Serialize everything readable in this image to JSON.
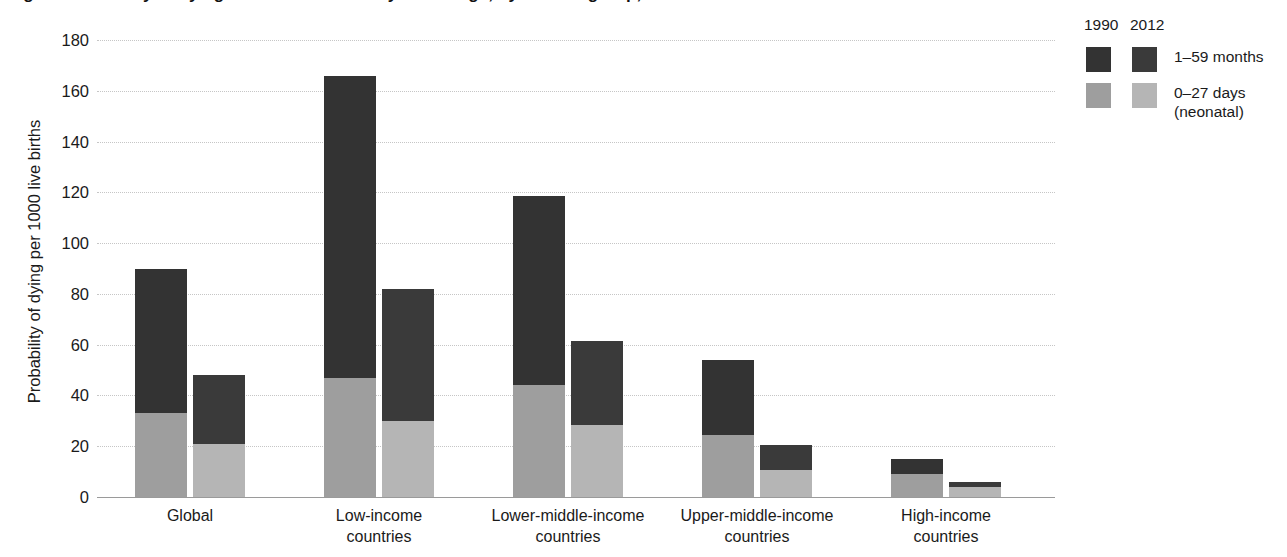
{
  "chart_data": {
    "type": "bar",
    "subtype": "grouped-stacked",
    "title": "Fig. 3: Probability of dying in children under 5 years of age, by income group, 1990 and 2012",
    "xlabel": "",
    "ylabel": "Probability of dying per 1000 live births",
    "ylim": [
      0,
      180
    ],
    "ytick_step": 20,
    "ytick_labels": [
      "180",
      "160",
      "140",
      "120",
      "100",
      "80",
      "60",
      "40",
      "20",
      "0"
    ],
    "ytick_values": [
      180,
      160,
      140,
      120,
      100,
      80,
      60,
      40,
      20,
      0
    ],
    "grid": "horizontal-dotted",
    "legend_position": "right",
    "categories": [
      {
        "line1": "Global",
        "line2": ""
      },
      {
        "line1": "Low-income",
        "line2": "countries"
      },
      {
        "line1": "Lower-middle-income",
        "line2": "countries"
      },
      {
        "line1": "Upper-middle-income",
        "line2": "countries"
      },
      {
        "line1": "High-income",
        "line2": "countries"
      }
    ],
    "group_labels": [
      "1990",
      "2012"
    ],
    "series": [
      {
        "name": "0–27 days (neonatal)",
        "group": "1990",
        "color": "#9e9e9e",
        "values": [
          33,
          47,
          44,
          24.5,
          9
        ]
      },
      {
        "name": "1–59 months",
        "group": "1990",
        "color": "#333333",
        "values": [
          57,
          119,
          74.5,
          29.5,
          6
        ]
      },
      {
        "name": "0–27 days (neonatal)",
        "group": "2012",
        "color": "#b5b5b5",
        "values": [
          21,
          30,
          28.5,
          10.5,
          4
        ]
      },
      {
        "name": "1–59 months",
        "group": "2012",
        "color": "#3a3a3a",
        "values": [
          27,
          52,
          33,
          10,
          2
        ]
      }
    ],
    "totals": {
      "1990": [
        90,
        166,
        118.5,
        54,
        15
      ],
      "2012": [
        48,
        82,
        61.5,
        20.5,
        6
      ]
    }
  },
  "legend": {
    "year_1990": "1990",
    "year_2012": "2012",
    "rows": [
      {
        "label_main": "1–59 months",
        "label_sub": "",
        "color_1990": "#333333",
        "color_2012": "#3a3a3a"
      },
      {
        "label_main": "0–27 days",
        "label_sub": "(neonatal)",
        "color_1990": "#9e9e9e",
        "color_2012": "#b5b5b5"
      }
    ]
  },
  "colors": {
    "dark_1990": "#333333",
    "dark_2012": "#3a3a3a",
    "light_1990": "#9e9e9e",
    "light_2012": "#b5b5b5",
    "gridline": "#c6c6c6",
    "axis": "#9a9a9a",
    "text": "#1a1a1a"
  }
}
